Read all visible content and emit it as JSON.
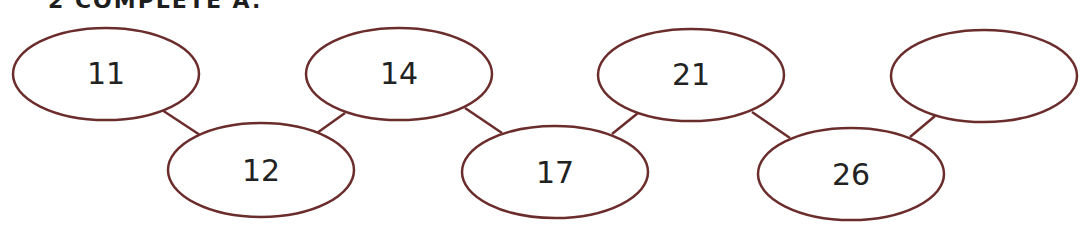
{
  "heading": "2 COMPLETE A.",
  "colors": {
    "stroke": "#6b2c2c",
    "text": "#222222"
  },
  "sequence": {
    "nodes": [
      {
        "label": "11",
        "cx": 106,
        "cy": 74,
        "row": "top"
      },
      {
        "label": "12",
        "cx": 261,
        "cy": 170,
        "row": "bottom"
      },
      {
        "label": "14",
        "cx": 399,
        "cy": 74,
        "row": "top"
      },
      {
        "label": "17",
        "cx": 555,
        "cy": 172,
        "row": "bottom"
      },
      {
        "label": "21",
        "cx": 691,
        "cy": 75,
        "row": "top"
      },
      {
        "label": "26",
        "cx": 851,
        "cy": 174,
        "row": "bottom"
      },
      {
        "label": "",
        "cx": 984,
        "cy": 76,
        "row": "top",
        "blank": true
      }
    ],
    "connectors": [
      {
        "from": 0,
        "to": 1
      },
      {
        "from": 1,
        "to": 2
      },
      {
        "from": 2,
        "to": 3
      },
      {
        "from": 3,
        "to": 4
      },
      {
        "from": 4,
        "to": 5
      },
      {
        "from": 5,
        "to": 6
      }
    ]
  }
}
